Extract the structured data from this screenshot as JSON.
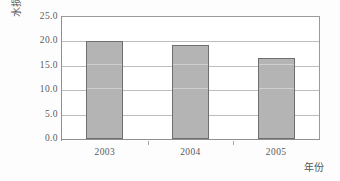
{
  "chart_data": {
    "type": "bar",
    "title": "",
    "categories": [
      "2003",
      "2004",
      "2005"
    ],
    "values": [
      20.0,
      19.3,
      16.7
    ],
    "series": [
      {
        "name": "水损",
        "values": [
          20.0,
          19.3,
          16.7
        ]
      }
    ],
    "xlabel": "年份",
    "ylabel": "水损(%)",
    "ylim": [
      0.0,
      25.0
    ],
    "ytick_labels": [
      "25.0",
      "20.0",
      "15.0",
      "10.0",
      "5.0",
      "0.0"
    ],
    "ytick_values": [
      25.0,
      20.0,
      15.0,
      10.0,
      5.0,
      0.0
    ],
    "grid": true,
    "legend": false,
    "legend_position": "none",
    "bar_color": "#b4b4b4",
    "bar_border_color": "#6e6e6e",
    "gridline_color": "#bdbdbd",
    "axis_color": "#8f8f8f",
    "background_color": "#ffffff"
  }
}
